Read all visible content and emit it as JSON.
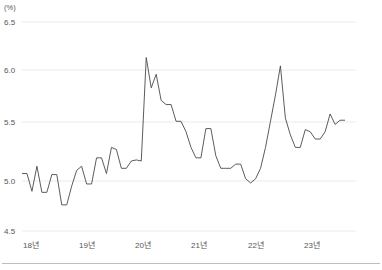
{
  "chart_data": {
    "type": "line",
    "title": "",
    "subtitle": "",
    "xlabel": "",
    "ylabel": "",
    "unit_label": "(%)",
    "ylim": [
      4.5,
      6.5
    ],
    "y_ticks": [
      "6.5",
      "6.0",
      "5.5",
      "5.0",
      "4.5"
    ],
    "y_tick_values": [
      6.5,
      6.0,
      5.5,
      5.0,
      4.5
    ],
    "grid": true,
    "legend": "none",
    "x_ticks": [
      "18년",
      "19년",
      "20년",
      "21년",
      "22년",
      "23년"
    ],
    "x_tick_values": [
      0,
      12,
      24,
      36,
      48,
      60
    ],
    "x_range": [
      0,
      66
    ],
    "series": [
      {
        "name": "실업률",
        "color": "#4a4a4a",
        "x": [
          0,
          1,
          2,
          3,
          4,
          5,
          6,
          7,
          8,
          9,
          10,
          11,
          12,
          13,
          14,
          15,
          16,
          17,
          18,
          19,
          20,
          21,
          22,
          23,
          24,
          25,
          26,
          27,
          28,
          29,
          30,
          31,
          32,
          33,
          34,
          35,
          36,
          37,
          38,
          39,
          40,
          41,
          42,
          43,
          44,
          45,
          46,
          47,
          48,
          49,
          50,
          51,
          52,
          53,
          54,
          55,
          56,
          57,
          58,
          59,
          60,
          61,
          62,
          63,
          64,
          65
        ],
        "values": [
          5.05,
          5.05,
          4.88,
          5.12,
          4.87,
          4.87,
          5.04,
          5.04,
          4.75,
          4.75,
          4.93,
          5.08,
          5.12,
          4.95,
          4.95,
          5.2,
          5.2,
          5.05,
          5.3,
          5.28,
          5.1,
          5.1,
          5.17,
          5.18,
          5.17,
          6.16,
          5.87,
          6.0,
          5.75,
          5.71,
          5.71,
          5.55,
          5.55,
          5.45,
          5.3,
          5.2,
          5.2,
          5.48,
          5.48,
          5.22,
          5.1,
          5.1,
          5.1,
          5.14,
          5.14,
          5.0,
          4.96,
          5.0,
          5.1,
          5.3,
          5.55,
          5.8,
          6.08,
          5.58,
          5.42,
          5.3,
          5.3,
          5.47,
          5.45,
          5.38,
          5.38,
          5.45,
          5.62,
          5.52,
          5.56,
          5.56
        ]
      }
    ]
  }
}
